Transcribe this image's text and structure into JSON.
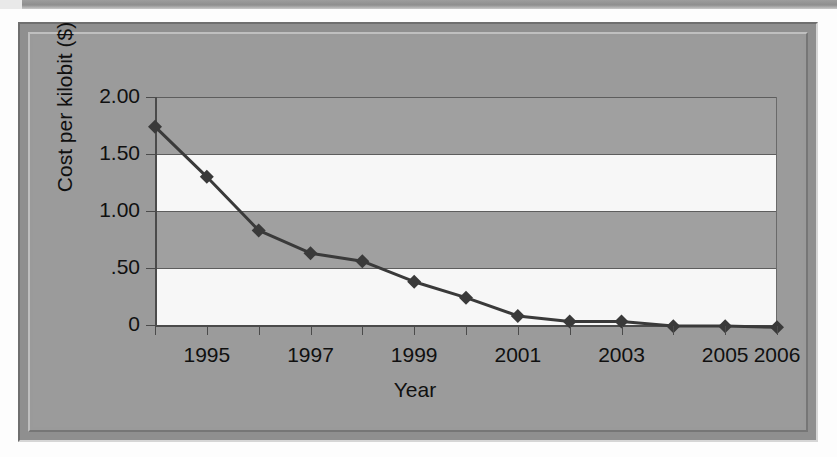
{
  "chart_data": {
    "type": "line",
    "title": "",
    "xlabel": "Year",
    "ylabel": "Cost per kilobit ($)",
    "x": [
      1994,
      1995,
      1996,
      1997,
      1998,
      1999,
      2000,
      2001,
      2002,
      2003,
      2004,
      2005,
      2006
    ],
    "categories": [
      "1994",
      "1995",
      "1996",
      "1997",
      "1998",
      "1999",
      "2000",
      "2001",
      "2002",
      "2003",
      "2004",
      "2005",
      "2006"
    ],
    "values": [
      1.74,
      1.3,
      0.83,
      0.63,
      0.56,
      0.38,
      0.24,
      0.08,
      0.03,
      0.03,
      -0.01,
      -0.01,
      -0.02
    ],
    "series": [
      {
        "name": "Cost per kilobit",
        "values": [
          1.74,
          1.3,
          0.83,
          0.63,
          0.56,
          0.38,
          0.24,
          0.08,
          0.03,
          0.03,
          -0.01,
          -0.01,
          -0.02
        ]
      }
    ],
    "xlim": [
      1994,
      2006
    ],
    "ylim": [
      0,
      2.0
    ],
    "ytick_values": [
      2.0,
      1.5,
      1.0,
      0.5,
      0
    ],
    "ytick_labels": [
      "2.00",
      "1.50",
      "1.00",
      ".50",
      "0"
    ],
    "xtick_values": [
      1995,
      1997,
      1999,
      2001,
      2003,
      2005,
      2006
    ],
    "xtick_labels": [
      "1995",
      "1997",
      "1999",
      "2001",
      "2003",
      "2005",
      "2006"
    ],
    "grid": true,
    "grid_axis": "y",
    "legend": false,
    "legend_position": "none",
    "marker": "diamond",
    "line_color": "#3a3a3a",
    "marker_color": "#3a3a3a",
    "band_colors": [
      "#a0a0a0",
      "#f7f7f7"
    ],
    "plot_background": "#a0a0a0",
    "frame_background": "#9b9b9b",
    "axis_color": "#4b4b4b",
    "text_color": "#101010"
  },
  "axis": {
    "x_title": "Year",
    "y_title": "Cost per kilobit ($)"
  },
  "y_labels": [
    {
      "text": "2.00",
      "value": 2.0
    },
    {
      "text": "1.50",
      "value": 1.5
    },
    {
      "text": "1.00",
      "value": 1.0
    },
    {
      "text": ".50",
      "value": 0.5
    },
    {
      "text": "0",
      "value": 0.0
    }
  ],
  "x_labels": [
    {
      "text": "1995",
      "value": 1995
    },
    {
      "text": "1997",
      "value": 1997
    },
    {
      "text": "1999",
      "value": 1999
    },
    {
      "text": "2001",
      "value": 2001
    },
    {
      "text": "2003",
      "value": 2003
    },
    {
      "text": "2005",
      "value": 2005
    },
    {
      "text": "2006",
      "value": 2006
    }
  ]
}
